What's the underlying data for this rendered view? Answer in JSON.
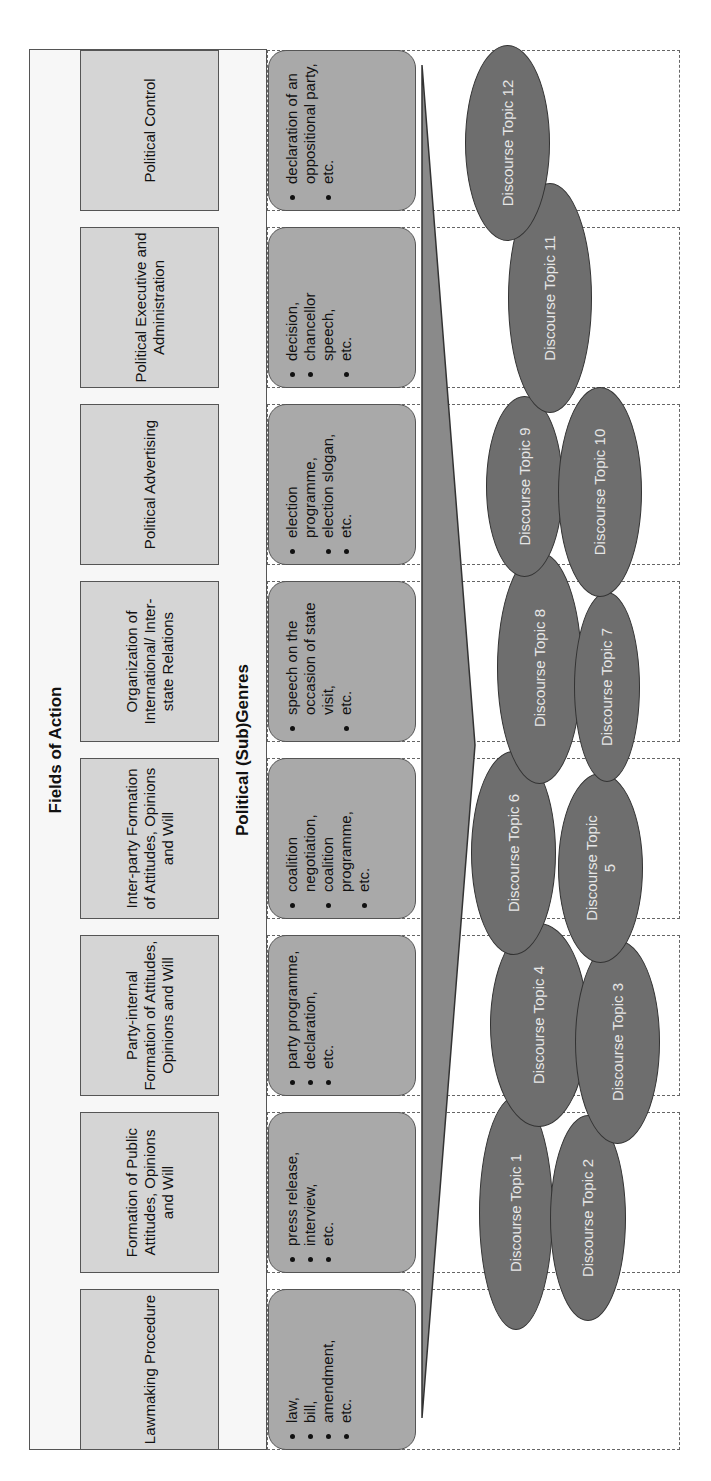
{
  "header": {
    "fields_title": "Fields of Action",
    "genres_title": "Political (Sub)Genres"
  },
  "fields": [
    {
      "label": "Lawmaking Procedure"
    },
    {
      "label": "Formation of Public Attitudes, Opinions and Will"
    },
    {
      "label": "Party-internal Formation of Attitudes, Opinions and Will"
    },
    {
      "label": "Inter-party Formation of Attitudes, Opinions and Will"
    },
    {
      "label": "Organization of International/ Inter-state Relations"
    },
    {
      "label": "Political Advertising"
    },
    {
      "label": "Political Executive and Administration"
    },
    {
      "label": "Political Control"
    }
  ],
  "genres": [
    {
      "items": [
        "law,",
        "bill,",
        "amendment,",
        "etc."
      ]
    },
    {
      "items": [
        "press release,",
        "interview,",
        "etc."
      ]
    },
    {
      "items": [
        "party programme,",
        "declaration,",
        "etc."
      ]
    },
    {
      "items": [
        "coalition negotiation,",
        "coalition programme,",
        "etc."
      ]
    },
    {
      "items": [
        "speech on the occasion of state visit,",
        "etc."
      ]
    },
    {
      "items": [
        "election programme,",
        "election slogan,",
        "etc."
      ]
    },
    {
      "items": [
        "decision,",
        "chancellor speech,",
        "etc."
      ]
    },
    {
      "items": [
        "declaration of an oppositional party,",
        "etc."
      ]
    }
  ],
  "topics": [
    {
      "label": "Discourse Topic 1"
    },
    {
      "label": "Discourse Topic 2"
    },
    {
      "label": "Discourse Topic 3"
    },
    {
      "label": "Discourse Topic 4"
    },
    {
      "label": "Discourse Topic 5"
    },
    {
      "label": "Discourse Topic 6"
    },
    {
      "label": "Discourse Topic 7"
    },
    {
      "label": "Discourse Topic 8"
    },
    {
      "label": "Discourse Topic 9"
    },
    {
      "label": "Discourse Topic 10"
    },
    {
      "label": "Discourse Topic 11"
    },
    {
      "label": "Discourse Topic 12"
    }
  ],
  "colors": {
    "field_fill": "#d5d5d5",
    "genre_fill": "#a9a9a9",
    "topic_fill": "#6e6e6e",
    "wedge_fill": "#8a8a8a"
  }
}
